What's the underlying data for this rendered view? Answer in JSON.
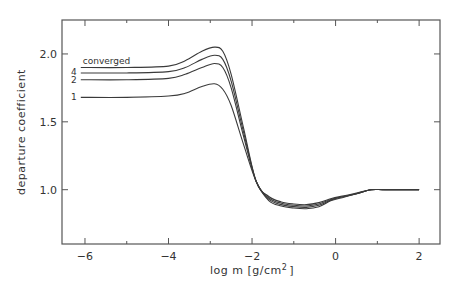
{
  "chart_data": {
    "type": "line",
    "title": "",
    "xlabel": "log m  [g/cm²]",
    "ylabel": "departure coefficient",
    "xlim": [
      -6.55,
      2.5
    ],
    "ylim": [
      0.6,
      2.25
    ],
    "xticks": [
      -6,
      -4,
      -2,
      0,
      2
    ],
    "xtick_labels": [
      "−6",
      "−4",
      "−2",
      "0",
      "2"
    ],
    "yticks": [
      1.0,
      1.5,
      2.0
    ],
    "ytick_labels": [
      "1.0",
      "1.5",
      "2.0"
    ],
    "grid": false,
    "legend": "inline labels at left end of curves",
    "series": [
      {
        "name": "converged",
        "x": [
          -6.1,
          -5,
          -4,
          -3.6,
          -3.2,
          -2.9,
          -2.7,
          -2.5,
          -2.2,
          -1.9,
          -1.6,
          -1.3,
          -1.0,
          -0.7,
          -0.4,
          -0.1,
          0.2,
          0.5,
          0.85,
          1.2,
          2.0
        ],
        "y": [
          1.9,
          1.9,
          1.91,
          1.95,
          2.02,
          2.05,
          2.02,
          1.85,
          1.45,
          1.06,
          0.95,
          0.91,
          0.895,
          0.89,
          0.905,
          0.935,
          0.955,
          0.975,
          1.0,
          1.0,
          1.0
        ]
      },
      {
        "name": "4",
        "x": [
          -6.1,
          -5,
          -4,
          -3.6,
          -3.2,
          -2.9,
          -2.7,
          -2.5,
          -2.2,
          -1.9,
          -1.6,
          -1.3,
          -1.0,
          -0.7,
          -0.4,
          -0.1,
          0.2,
          0.5,
          0.85,
          1.2,
          2.0
        ],
        "y": [
          1.86,
          1.86,
          1.87,
          1.9,
          1.96,
          1.99,
          1.96,
          1.8,
          1.42,
          1.06,
          0.94,
          0.9,
          0.885,
          0.88,
          0.895,
          0.93,
          0.95,
          0.97,
          1.0,
          1.0,
          1.0
        ]
      },
      {
        "name": "2",
        "x": [
          -6.1,
          -5,
          -4,
          -3.6,
          -3.2,
          -2.9,
          -2.7,
          -2.5,
          -2.2,
          -1.9,
          -1.6,
          -1.3,
          -1.0,
          -0.7,
          -0.4,
          -0.1,
          0.2,
          0.5,
          0.85,
          1.2,
          2.0
        ],
        "y": [
          1.81,
          1.81,
          1.82,
          1.85,
          1.9,
          1.93,
          1.9,
          1.75,
          1.39,
          1.06,
          0.93,
          0.89,
          0.875,
          0.87,
          0.885,
          0.925,
          0.95,
          0.97,
          1.0,
          1.0,
          1.0
        ]
      },
      {
        "name": "1",
        "x": [
          -6.1,
          -5,
          -4,
          -3.6,
          -3.2,
          -2.9,
          -2.7,
          -2.5,
          -2.2,
          -1.9,
          -1.6,
          -1.3,
          -1.0,
          -0.7,
          -0.4,
          -0.1,
          0.2,
          0.5,
          0.85,
          1.2,
          2.0
        ],
        "y": [
          1.68,
          1.68,
          1.69,
          1.71,
          1.76,
          1.78,
          1.74,
          1.62,
          1.33,
          1.06,
          0.92,
          0.88,
          0.865,
          0.86,
          0.875,
          0.92,
          0.945,
          0.97,
          1.0,
          1.0,
          1.0
        ]
      }
    ]
  },
  "labels": {
    "xlabel_main": "log m  [g/cm",
    "xlabel_sup": "2",
    "xlabel_end": "]",
    "ylabel": "departure coefficient"
  },
  "colors": {
    "line": "#3a3a3a",
    "axis": "#555555"
  }
}
